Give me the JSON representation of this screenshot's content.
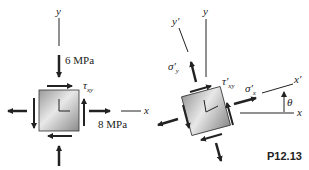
{
  "figure": {
    "id": "P12.13",
    "left_element": {
      "axis_x": "x",
      "axis_y": "y",
      "normal_stress_y": "6 MPa",
      "normal_stress_x": "8 MPa",
      "shear_label": "τ",
      "shear_sub": "xy"
    },
    "right_element": {
      "axis_x": "x",
      "axis_y": "y",
      "axis_x_prime": "x′",
      "axis_y_prime": "y′",
      "sigma_x_prime": "σ′",
      "sigma_x_sub": "x",
      "sigma_y_prime": "σ′",
      "sigma_y_sub": "y",
      "shear_label": "τ′",
      "shear_sub": "xy",
      "angle": "θ"
    }
  },
  "colors": {
    "line": "#222222",
    "element_light": "#e6e6e6",
    "element_dark": "#8c8c8c"
  }
}
